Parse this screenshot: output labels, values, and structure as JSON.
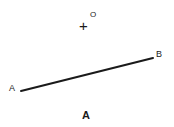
{
  "figure": {
    "width": 174,
    "height": 127,
    "background_color": "#ffffff",
    "ink_color": "#1a1a1a",
    "panel_caption": "A",
    "origin_marker": {
      "cross_glyph": "+",
      "superscript_label": "O",
      "x": 85,
      "y": 22
    },
    "segment": {
      "stroke_color": "#1a1a1a",
      "stroke_width": 2,
      "start_label": "A",
      "end_label": "B",
      "start": {
        "x": 21,
        "y": 91
      },
      "end": {
        "x": 153,
        "y": 58
      }
    }
  },
  "chart_data": {
    "type": "scatter",
    "title": "A",
    "xlabel": "",
    "ylabel": "",
    "grid": false,
    "legend": false,
    "annotations": [
      "A",
      "B",
      "+",
      "O"
    ],
    "series": [
      {
        "name": "segment-AB",
        "kind": "line",
        "points": [
          {
            "label": "A",
            "x": 21,
            "y": 91
          },
          {
            "label": "B",
            "x": 153,
            "y": 58
          }
        ]
      },
      {
        "name": "origin-O",
        "kind": "marker",
        "points": [
          {
            "label": "O",
            "x": 85,
            "y": 22
          }
        ]
      }
    ]
  }
}
